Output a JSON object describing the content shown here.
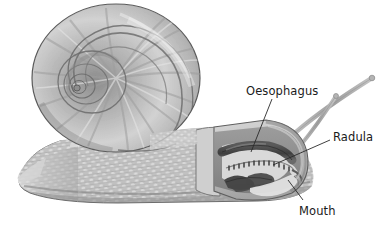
{
  "figure": {
    "background_color": "#ffffff",
    "palette": {
      "ink": "#1b1b1b",
      "leader": "#2a2a2a",
      "shell_light": "#e9e9e9",
      "shell_mid": "#b6b6b6",
      "shell_dark": "#7e7e7e",
      "shell_outline": "#555555",
      "foot_light": "#e2e2e2",
      "foot_mid": "#b9b9b9",
      "foot_dark": "#8a8a8a",
      "head_fill": "#c3c3c3",
      "head_rim": "#6f6f6f",
      "cavity_dark": "#8f8f8f",
      "oesophagus_dark": "#4a4a4a",
      "radula_band": "#9a9a9a",
      "muscle_dark": "#4f4f4f",
      "tentacle": "#a8a8a8"
    }
  },
  "labels": [
    {
      "id": "oesophagus",
      "text": "Oesophagus",
      "text_x": 246,
      "text_y": 84,
      "leader": {
        "x1": 272,
        "y1": 99,
        "x2": 251,
        "y2": 152
      }
    },
    {
      "id": "radula",
      "text": "Radula",
      "text_x": 333,
      "text_y": 130,
      "leader": {
        "x1": 330,
        "y1": 140,
        "x2": 273,
        "y2": 165
      }
    },
    {
      "id": "mouth",
      "text": "Mouth",
      "text_x": 299,
      "text_y": 204,
      "leader": {
        "x1": 303,
        "y1": 200,
        "x2": 288,
        "y2": 180
      }
    }
  ],
  "parts": [
    {
      "id": "shell",
      "name": "spiral-shell"
    },
    {
      "id": "foot",
      "name": "muscular-foot"
    },
    {
      "id": "head",
      "name": "head-cutaway"
    },
    {
      "id": "tentacles",
      "name": "tentacles",
      "count": 2
    },
    {
      "id": "oesophagus",
      "name": "oesophagus-tube"
    },
    {
      "id": "radula",
      "name": "radula-ribbon"
    },
    {
      "id": "mouth",
      "name": "mouth-opening"
    }
  ]
}
